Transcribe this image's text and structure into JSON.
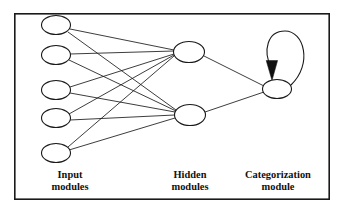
{
  "figure": {
    "type": "neural-network-architecture-diagram",
    "background_color": "#ffffff",
    "ink_color": "#1a1a1a",
    "frame": {
      "x": 14,
      "y": 13,
      "width": 316,
      "height": 187
    }
  },
  "labels": {
    "input": {
      "line1": "Input",
      "line2": "modules",
      "x": 70,
      "y": 180
    },
    "hidden": {
      "line1": "Hidden",
      "line2": "modules",
      "x": 190,
      "y": 180
    },
    "categorization": {
      "line1": "Categorization",
      "line2": "module",
      "x": 278,
      "y": 180
    }
  },
  "layers": [
    {
      "name": "input",
      "node_count": 5,
      "nodes": [
        {
          "id": "i1",
          "cx": 56,
          "cy": 25,
          "rx": 14.5,
          "ry": 9.5
        },
        {
          "id": "i2",
          "cx": 56,
          "cy": 55,
          "rx": 14.5,
          "ry": 9.5
        },
        {
          "id": "i3",
          "cx": 56,
          "cy": 90,
          "rx": 14.5,
          "ry": 9.5
        },
        {
          "id": "i4",
          "cx": 56,
          "cy": 118,
          "rx": 14.5,
          "ry": 9.5
        },
        {
          "id": "i5",
          "cx": 56,
          "cy": 153,
          "rx": 14.5,
          "ry": 9.5
        }
      ]
    },
    {
      "name": "hidden",
      "node_count": 2,
      "nodes": [
        {
          "id": "h1",
          "cx": 189,
          "cy": 52,
          "rx": 15.5,
          "ry": 10.5
        },
        {
          "id": "h2",
          "cx": 190,
          "cy": 115,
          "rx": 15.5,
          "ry": 10.5
        }
      ]
    },
    {
      "name": "categorization",
      "node_count": 1,
      "nodes": [
        {
          "id": "c1",
          "cx": 277,
          "cy": 89,
          "rx": 14.5,
          "ry": 9.5
        }
      ]
    }
  ],
  "edges": [
    {
      "from": "i1",
      "to": "h1"
    },
    {
      "from": "i1",
      "to": "h2"
    },
    {
      "from": "i2",
      "to": "h1"
    },
    {
      "from": "i2",
      "to": "h2"
    },
    {
      "from": "i3",
      "to": "h1"
    },
    {
      "from": "i3",
      "to": "h2"
    },
    {
      "from": "i4",
      "to": "h1"
    },
    {
      "from": "i4",
      "to": "h2"
    },
    {
      "from": "i5",
      "to": "h1"
    },
    {
      "from": "i5",
      "to": "h2"
    },
    {
      "from": "h1",
      "to": "c1"
    },
    {
      "from": "h2",
      "to": "c1"
    }
  ],
  "self_loop": {
    "on_node": "c1",
    "arrow_direction": "down",
    "arrow_tip": {
      "x": 272,
      "y": 79
    },
    "path": "M 291 85 C 312 66, 305 32, 285 32 C 268 32, 264 50, 272 68"
  }
}
